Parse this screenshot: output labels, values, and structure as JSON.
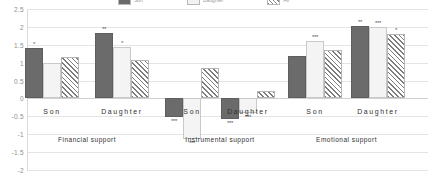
{
  "chart_data": {
    "type": "bar",
    "title": "",
    "subtitle": "",
    "xlabel": "",
    "ylabel": "",
    "ylim": [
      -2,
      2.5
    ],
    "ytick_labels": [
      "2.5",
      "2",
      "1.5",
      "1",
      "0.5",
      "0",
      "-0.5",
      "-1",
      "-1.5",
      "-2"
    ],
    "ytick_values": [
      2.5,
      2,
      1.5,
      1,
      0.5,
      0,
      -0.5,
      -1,
      -1.5,
      -2
    ],
    "grid": true,
    "legend_position": "top",
    "legend": [
      "Son",
      "Daughter",
      "All"
    ],
    "categories": [
      "Son",
      "Daughter",
      "Son",
      "Daughter",
      "Son",
      "Daughter"
    ],
    "group_labels": [
      "Financial support",
      "Instrumental support",
      "Emotional support"
    ],
    "series": [
      {
        "name": "Series 1",
        "style": "dark",
        "values": [
          1.4,
          1.83,
          -0.52,
          -0.58,
          1.2,
          2.02
        ],
        "sig": [
          "*",
          "**",
          "***",
          "***",
          "",
          "**"
        ]
      },
      {
        "name": "Series 2",
        "style": "light",
        "values": [
          1.0,
          1.43,
          -1.12,
          -0.4,
          1.6,
          2.0
        ],
        "sig": [
          "",
          "*",
          "***",
          "***",
          "***",
          "***"
        ]
      },
      {
        "name": "Series 3",
        "style": "hatch",
        "values": [
          1.15,
          1.08,
          0.85,
          0.2,
          1.35,
          1.8
        ],
        "sig": [
          "",
          "",
          "",
          "",
          "",
          "*"
        ]
      }
    ]
  }
}
